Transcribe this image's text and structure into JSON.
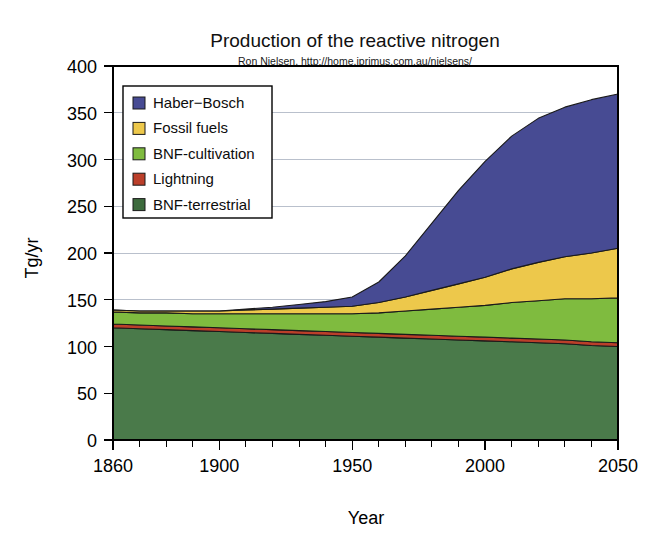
{
  "chart_data": {
    "type": "area",
    "title": "Production of the reactive nitrogen",
    "subtitle": "Ron Nielsen, http://home.iprimus.com.au/nielsens/",
    "xlabel": "Year",
    "ylabel": "Tg/yr",
    "stacked": true,
    "grid": true,
    "legend_position": "top-left-inside",
    "xlim": [
      1860,
      2050
    ],
    "ylim": [
      0,
      400
    ],
    "xticks": [
      1860,
      1900,
      1950,
      2000,
      2050
    ],
    "xtick_labels": [
      "1860",
      "1900",
      "1950",
      "2000",
      "2050"
    ],
    "xminor_step": 10,
    "yticks": [
      0,
      50,
      100,
      150,
      200,
      250,
      300,
      350,
      400
    ],
    "ytick_labels": [
      "0",
      "50",
      "100",
      "150",
      "200",
      "250",
      "300",
      "350",
      "400"
    ],
    "x": [
      1860,
      1870,
      1880,
      1890,
      1900,
      1910,
      1920,
      1930,
      1940,
      1950,
      1960,
      1970,
      1980,
      1990,
      2000,
      2010,
      2020,
      2030,
      2040,
      2050
    ],
    "series": [
      {
        "name": "BNF-terrestrial",
        "color": "#4a7a4a",
        "stack_order": 1,
        "values": [
          120,
          119,
          118,
          117,
          116,
          115,
          114,
          113,
          112,
          111,
          110,
          109,
          108,
          107,
          106,
          105,
          104,
          103,
          101,
          100
        ]
      },
      {
        "name": "Lightning",
        "color": "#bb3f2a",
        "stack_order": 2,
        "values": [
          4,
          4,
          4,
          4,
          4,
          4,
          4,
          4,
          4,
          4,
          4,
          4,
          4,
          4,
          4,
          4,
          4,
          4,
          4,
          4
        ]
      },
      {
        "name": "BNF-cultivation",
        "color": "#7fbb3f",
        "stack_order": 3,
        "values": [
          13,
          13,
          14,
          14,
          15,
          16,
          17,
          18,
          19,
          20,
          22,
          25,
          28,
          31,
          34,
          38,
          41,
          44,
          46,
          48
        ]
      },
      {
        "name": "Fossil fuels",
        "color": "#edc84b",
        "stack_order": 4,
        "values": [
          2,
          2,
          2,
          3,
          3,
          4,
          5,
          6,
          7,
          8,
          11,
          15,
          20,
          25,
          30,
          36,
          41,
          45,
          49,
          53
        ]
      },
      {
        "name": "Haber−Bosch",
        "color": "#474b93",
        "stack_order": 5,
        "values": [
          0,
          0,
          0,
          0,
          0,
          1,
          2,
          4,
          6,
          10,
          22,
          44,
          72,
          100,
          124,
          142,
          154,
          160,
          164,
          165
        ]
      }
    ],
    "stack_totals_note": [
      {
        "year": 1860,
        "total": 139
      },
      {
        "year": 1950,
        "total": 153
      },
      {
        "year": 2000,
        "total": 298
      },
      {
        "year": 2050,
        "total": 370
      }
    ]
  },
  "legend": {
    "items": [
      {
        "label": "Haber−Bosch",
        "color": "#474b93"
      },
      {
        "label": "Fossil fuels",
        "color": "#edc84b"
      },
      {
        "label": "BNF-cultivation",
        "color": "#7fbb3f"
      },
      {
        "label": "Lightning",
        "color": "#bb3f2a"
      },
      {
        "label": "BNF-terrestrial",
        "color": "#3d6b3d"
      }
    ]
  }
}
